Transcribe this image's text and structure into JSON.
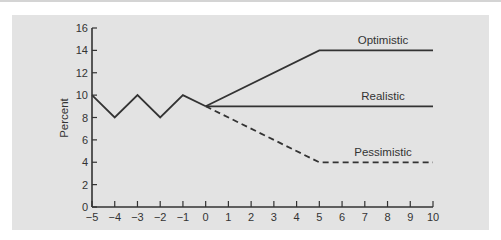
{
  "chart_data": {
    "type": "line",
    "title": "",
    "xlabel": "",
    "ylabel": "Percent",
    "xlim": [
      -5,
      10
    ],
    "ylim": [
      0,
      16
    ],
    "xticks": [
      -5,
      -4,
      -3,
      -2,
      -1,
      0,
      1,
      2,
      3,
      4,
      5,
      6,
      7,
      8,
      9,
      10
    ],
    "xtick_labels": [
      "−5",
      "−4",
      "−3",
      "−2",
      "−1",
      "0",
      "1",
      "2",
      "3",
      "4",
      "5",
      "6",
      "7",
      "8",
      "9",
      "10"
    ],
    "yticks": [
      0,
      2,
      4,
      6,
      8,
      10,
      12,
      14,
      16
    ],
    "ytick_labels": [
      "0",
      "2",
      "4",
      "6",
      "8",
      "10",
      "12",
      "14",
      "16"
    ],
    "grid": false,
    "legend": "inline labels",
    "series": [
      {
        "name": "History",
        "style": "solid",
        "x": [
          -5,
          -4,
          -3,
          -2,
          -1,
          0
        ],
        "values": [
          10,
          8,
          10,
          8,
          10,
          9
        ]
      },
      {
        "name": "Optimistic",
        "label": "Optimistic",
        "style": "solid",
        "x": [
          0,
          5,
          10
        ],
        "values": [
          9,
          14,
          14
        ]
      },
      {
        "name": "Realistic",
        "label": "Realistic",
        "style": "solid",
        "x": [
          0,
          10
        ],
        "values": [
          9,
          9
        ]
      },
      {
        "name": "Pessimistic",
        "label": "Pessimistic",
        "style": "dashed",
        "x": [
          0,
          5,
          10
        ],
        "values": [
          9,
          4,
          4
        ]
      }
    ]
  },
  "colors": {
    "panel": "#e3e3e3",
    "line": "#333333",
    "text": "#333333"
  }
}
